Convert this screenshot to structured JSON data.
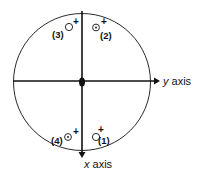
{
  "diagram": {
    "axes": {
      "horizontal": {
        "label_var": "y",
        "label_word": "axis"
      },
      "vertical": {
        "label_var": "x",
        "label_word": "axis"
      }
    },
    "markers": [
      {
        "id": "1",
        "label": "(1)",
        "symbol": "open-circle",
        "sign": "+"
      },
      {
        "id": "2",
        "label": "(2)",
        "symbol": "dot-circle",
        "sign": "+"
      },
      {
        "id": "3",
        "label": "(3)",
        "symbol": "open-circle",
        "sign": "+"
      },
      {
        "id": "4",
        "label": "(4)",
        "symbol": "dot-circle",
        "sign": "+"
      }
    ],
    "colors": {
      "ink": "#111111",
      "background": "#ffffff"
    }
  }
}
